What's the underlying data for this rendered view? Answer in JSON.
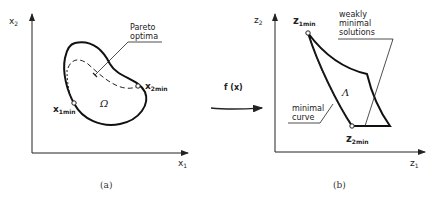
{
  "panel_a": {
    "caption": "(a)",
    "axis_x_label": "x",
    "axis_x_sub": "1",
    "axis_y_label": "x",
    "axis_y_sub": "2",
    "region_label": "Ω",
    "pareto_label_line1": "Pareto",
    "pareto_label_line2": "optima",
    "point1_label": "x",
    "point1_sub": "1min",
    "point2_label": "x",
    "point2_sub": "2min"
  },
  "mapping": {
    "label": "f (x)"
  },
  "panel_b": {
    "caption": "(b)",
    "axis_x_label": "z",
    "axis_x_sub": "1",
    "axis_y_label": "z",
    "axis_y_sub": "2",
    "region_label": "Λ",
    "weak_label_line1": "weakly",
    "weak_label_line2": "minimal",
    "weak_label_line3": "solutions",
    "minimal_label_line1": "minimal",
    "minimal_label_line2": "curve",
    "point1_label": "z",
    "point1_sub": "1min",
    "point2_label": "z",
    "point2_sub": "2min"
  }
}
